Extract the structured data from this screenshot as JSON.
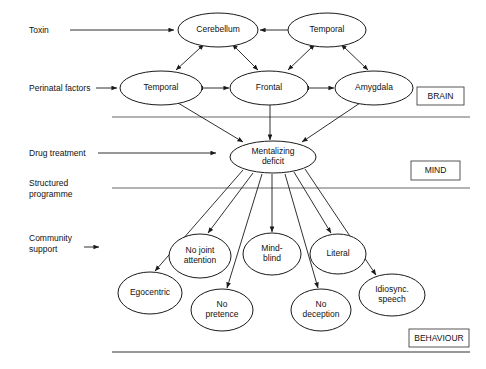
{
  "figure": {
    "background": "#ffffff",
    "stroke_color": "#1a1a1a",
    "divider_color": "#555555"
  },
  "tiers": [
    {
      "id": "brain",
      "label": "BRAIN",
      "box": {
        "x": 417,
        "y": 87,
        "w": 47,
        "h": 18
      }
    },
    {
      "id": "mind",
      "label": "MIND",
      "box": {
        "x": 411,
        "y": 161,
        "w": 49,
        "h": 19
      }
    },
    {
      "id": "behaviour",
      "label": "BEHAVIOUR",
      "box": {
        "x": 409,
        "y": 329,
        "w": 60,
        "h": 18
      }
    }
  ],
  "dividers": [
    {
      "id": "brain-mind-divider",
      "x1": 112,
      "y1": 117,
      "x2": 470,
      "y2": 117
    },
    {
      "id": "mind-behaviour-divider",
      "x1": 112,
      "y1": 188,
      "x2": 470,
      "y2": 188
    },
    {
      "id": "bottom-rule",
      "x1": 112,
      "y1": 352,
      "x2": 470,
      "y2": 352
    }
  ],
  "inputs": [
    {
      "id": "toxin",
      "label": "Toxin",
      "label_x": 29,
      "label_y": 33,
      "arrow": {
        "x1": 70,
        "y1": 30,
        "x2": 174,
        "y2": 30
      }
    },
    {
      "id": "perinatal-factors",
      "label": "Perinatal factors",
      "label_x": 29,
      "label_y": 91,
      "arrow": {
        "x1": 96,
        "y1": 88,
        "x2": 117,
        "y2": 88
      }
    },
    {
      "id": "drug-treatment",
      "label": "Drug treatment",
      "label_x": 29,
      "label_y": 156,
      "arrow": {
        "x1": 98,
        "y1": 153,
        "x2": 216,
        "y2": 153
      }
    },
    {
      "id": "structured-programme",
      "label": "Structured",
      "label2": "programme",
      "label_x": 29,
      "label_y": 186,
      "arrow": null
    },
    {
      "id": "community-support",
      "label": "Community",
      "label2": "support",
      "label_x": 29,
      "label_y": 241,
      "arrow": {
        "x1": 84,
        "y1": 247,
        "x2": 99,
        "y2": 247
      }
    }
  ],
  "nodes": [
    {
      "id": "cerebellum",
      "label": "Cerebellum",
      "cx": 218,
      "cy": 30,
      "rx": 40,
      "ry": 17,
      "tier": "brain",
      "lines": [
        "Cerebellum"
      ]
    },
    {
      "id": "temporal-top",
      "label": "Temporal",
      "cx": 327,
      "cy": 30,
      "rx": 39,
      "ry": 17,
      "tier": "brain",
      "lines": [
        "Temporal"
      ]
    },
    {
      "id": "temporal-left",
      "label": "Temporal",
      "cx": 161,
      "cy": 88,
      "rx": 41,
      "ry": 17,
      "tier": "brain",
      "lines": [
        "Temporal"
      ]
    },
    {
      "id": "frontal",
      "label": "Frontal",
      "cx": 269,
      "cy": 88,
      "rx": 39,
      "ry": 17,
      "tier": "brain",
      "lines": [
        "Frontal"
      ]
    },
    {
      "id": "amygdala",
      "label": "Amygdala",
      "cx": 374,
      "cy": 88,
      "rx": 39,
      "ry": 17,
      "tier": "brain",
      "lines": [
        "Amygdala"
      ]
    },
    {
      "id": "mentalizing-deficit",
      "label": "Mentalizing deficit",
      "cx": 273,
      "cy": 157,
      "rx": 43,
      "ry": 16,
      "tier": "mind",
      "lines": [
        "Mentalizing",
        "deficit"
      ]
    },
    {
      "id": "no-joint-attention",
      "label": "No joint attention",
      "cx": 200,
      "cy": 256,
      "rx": 31,
      "ry": 22,
      "tier": "behaviour",
      "lines": [
        "No joint",
        "attention"
      ]
    },
    {
      "id": "mind-blind",
      "label": "Mind-blind",
      "cx": 272,
      "cy": 254,
      "rx": 29,
      "ry": 21,
      "tier": "behaviour",
      "lines": [
        "Mind-",
        "blind"
      ]
    },
    {
      "id": "literal",
      "label": "Literal",
      "cx": 338,
      "cy": 254,
      "rx": 28,
      "ry": 20,
      "tier": "behaviour",
      "lines": [
        "Literal"
      ]
    },
    {
      "id": "egocentric",
      "label": "Egocentric",
      "cx": 150,
      "cy": 293,
      "rx": 32,
      "ry": 21,
      "tier": "behaviour",
      "lines": [
        "Egocentric"
      ]
    },
    {
      "id": "no-pretence",
      "label": "No pretence",
      "cx": 222,
      "cy": 310,
      "rx": 31,
      "ry": 21,
      "tier": "behaviour",
      "lines": [
        "No",
        "pretence"
      ]
    },
    {
      "id": "no-deception",
      "label": "No deception",
      "cx": 321,
      "cy": 310,
      "rx": 30,
      "ry": 21,
      "tier": "behaviour",
      "lines": [
        "No",
        "deception"
      ]
    },
    {
      "id": "idiosync-speech",
      "label": "Idiosync. speech",
      "cx": 392,
      "cy": 295,
      "rx": 33,
      "ry": 21,
      "tier": "behaviour",
      "lines": [
        "Idiosync.",
        "speech"
      ]
    }
  ],
  "edges": [
    {
      "id": "temporal-top-to-cerebellum",
      "from": "temporal-top",
      "to": "cerebellum",
      "type": "single",
      "x1": 288,
      "y1": 30,
      "x2": 260,
      "y2": 30
    },
    {
      "id": "cerebellum-temporal-left",
      "from": "cerebellum",
      "to": "temporal-left",
      "type": "double",
      "x1": 200,
      "y1": 48,
      "x2": 176,
      "y2": 70
    },
    {
      "id": "cerebellum-frontal",
      "from": "cerebellum",
      "to": "frontal",
      "type": "double",
      "x1": 236,
      "y1": 48,
      "x2": 258,
      "y2": 70
    },
    {
      "id": "temporal-top-frontal",
      "from": "temporal-top",
      "to": "frontal",
      "type": "double",
      "x1": 311,
      "y1": 48,
      "x2": 288,
      "y2": 70
    },
    {
      "id": "temporal-top-amygdala",
      "from": "temporal-top",
      "to": "amygdala",
      "type": "double",
      "x1": 345,
      "y1": 48,
      "x2": 368,
      "y2": 70
    },
    {
      "id": "temporal-left-frontal",
      "from": "temporal-left",
      "to": "frontal",
      "type": "double",
      "x1": 203,
      "y1": 88,
      "x2": 229,
      "y2": 88
    },
    {
      "id": "frontal-amygdala",
      "from": "frontal",
      "to": "amygdala",
      "type": "double",
      "x1": 309,
      "y1": 88,
      "x2": 334,
      "y2": 88
    },
    {
      "id": "temporal-left-to-mentalizing",
      "from": "temporal-left",
      "to": "mentalizing-deficit",
      "type": "single",
      "x1": 178,
      "y1": 103,
      "x2": 243,
      "y2": 142
    },
    {
      "id": "frontal-to-mentalizing",
      "from": "frontal",
      "to": "mentalizing-deficit",
      "type": "single",
      "x1": 270,
      "y1": 105,
      "x2": 270,
      "y2": 140
    },
    {
      "id": "amygdala-to-mentalizing",
      "from": "amygdala",
      "to": "mentalizing-deficit",
      "type": "single",
      "x1": 360,
      "y1": 103,
      "x2": 302,
      "y2": 142
    },
    {
      "id": "mentalizing-to-egocentric",
      "from": "mentalizing-deficit",
      "to": "egocentric",
      "type": "single",
      "x1": 243,
      "y1": 170,
      "x2": 155,
      "y2": 271
    },
    {
      "id": "mentalizing-to-no-joint-attention",
      "from": "mentalizing-deficit",
      "to": "no-joint-attention",
      "type": "single",
      "x1": 253,
      "y1": 173,
      "x2": 208,
      "y2": 233
    },
    {
      "id": "mentalizing-to-no-pretence",
      "from": "mentalizing-deficit",
      "to": "no-pretence",
      "type": "single",
      "x1": 262,
      "y1": 174,
      "x2": 227,
      "y2": 288
    },
    {
      "id": "mentalizing-to-mind-blind",
      "from": "mentalizing-deficit",
      "to": "mind-blind",
      "type": "single",
      "x1": 272,
      "y1": 174,
      "x2": 272,
      "y2": 232
    },
    {
      "id": "mentalizing-to-no-deception",
      "from": "mentalizing-deficit",
      "to": "no-deception",
      "type": "single",
      "x1": 285,
      "y1": 174,
      "x2": 318,
      "y2": 288
    },
    {
      "id": "mentalizing-to-literal",
      "from": "mentalizing-deficit",
      "to": "literal",
      "type": "single",
      "x1": 294,
      "y1": 172,
      "x2": 331,
      "y2": 233
    },
    {
      "id": "mentalizing-to-idiosync-speech",
      "from": "mentalizing-deficit",
      "to": "idiosync-speech",
      "type": "single",
      "x1": 305,
      "y1": 169,
      "x2": 376,
      "y2": 275
    }
  ]
}
